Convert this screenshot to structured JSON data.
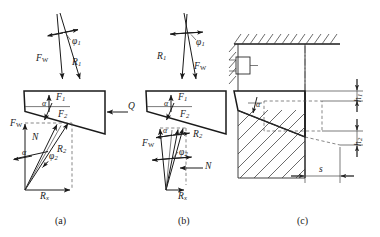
{
  "figure": {
    "type": "engineering-force-diagram",
    "background": "#ffffff",
    "line_color": "#1a1a1a",
    "panels": [
      {
        "id": "a",
        "caption": "(a)",
        "description": "Wedge free-body with applied force Q and resultant force triangle",
        "labels": {
          "phi1": "φ",
          "phi1_sub": "1",
          "Fw_top": "F",
          "Fw_top_sub": "W",
          "R1": "R",
          "R1_sub": "1",
          "F1": "F",
          "F1_sub": "1",
          "F2": "F",
          "F2_sub": "2",
          "Q": "Q",
          "alpha_wedge": "α",
          "Fw_bottom": "F",
          "Fw_bottom_sub": "W",
          "N": "N",
          "alpha_poly": "α",
          "R2": "R",
          "R2_sub": "2",
          "phi2": "φ",
          "phi2_sub": "2",
          "Rx": "R",
          "Rx_sub": "x"
        }
      },
      {
        "id": "b",
        "caption": "(b)",
        "description": "Mirrored wedge free-body with narrow resultant force polygon, no external Q",
        "labels": {
          "phi1": "φ",
          "phi1_sub": "1",
          "R1": "R",
          "R1_sub": "1",
          "Fw_top": "F",
          "Fw_top_sub": "W",
          "F1": "F",
          "F1_sub": "1",
          "F2": "F",
          "F2_sub": "2",
          "alpha_wedge": "α",
          "alpha_poly": "α",
          "R2": "R",
          "R2_sub": "2",
          "Fw_bottom": "F",
          "Fw_bottom_sub": "W",
          "phi2": "φ",
          "phi2_sub": "2",
          "N": "N",
          "Rx": "R",
          "Rx_sub": "x"
        }
      },
      {
        "id": "c",
        "caption": "(c)",
        "description": "Sectional assembly: hatched fixed ceiling, wedge member and hatched workpiece with height and stroke dimensions",
        "labels": {
          "alpha": "α",
          "h_upper": "h",
          "h_upper_sub": "1",
          "h_lower": "h",
          "h_lower_sub": "2",
          "s": "s"
        }
      }
    ]
  }
}
